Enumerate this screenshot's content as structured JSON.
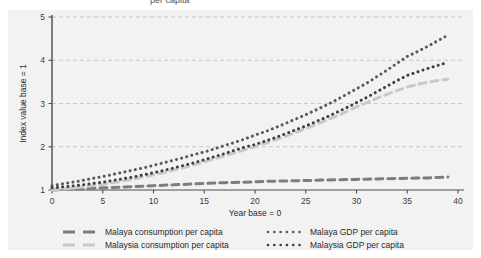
{
  "figure": {
    "background": "#f2f2f2",
    "partial_top_text": "per capita",
    "axis": {
      "ylabel": "Index value base = 1",
      "xlabel": "Year base = 0",
      "yticks": [
        1,
        2,
        3,
        4,
        5
      ],
      "xticks": [
        0,
        5,
        10,
        15,
        20,
        25,
        30,
        35,
        40
      ]
    }
  },
  "colors": {
    "dark_gray": "#7d7d7d",
    "light_gray": "#c9c9c9",
    "dark_dotted": "#4a4a4a",
    "axis": "#4d4d4d",
    "grid": "#bdbdbd",
    "panel": "#f2f2f2",
    "text": "#2b2b2b"
  },
  "legend": {
    "entries": [
      {
        "label": "Malaya consumption per capita",
        "style": "dashed",
        "color": "#7d7d7d",
        "col": 0,
        "row": 0
      },
      {
        "label": "Malaysia consumption per capita",
        "style": "dashed",
        "color": "#c9c9c9",
        "col": 0,
        "row": 1
      },
      {
        "label": "Malaya GDP per capita",
        "style": "dotted",
        "color": "#5a5a5a",
        "col": 1,
        "row": 0
      },
      {
        "label": "Malaysia GDP per capita",
        "style": "dotted",
        "color": "#3f3f3f",
        "col": 1,
        "row": 1
      }
    ]
  },
  "chart_data": {
    "type": "line",
    "title": "",
    "xlabel": "Year base = 0",
    "ylabel": "Index value base = 1",
    "xlim": [
      0,
      40
    ],
    "ylim": [
      1,
      5
    ],
    "xticks": [
      0,
      5,
      10,
      15,
      20,
      25,
      30,
      35,
      40
    ],
    "yticks": [
      1,
      2,
      3,
      4,
      5
    ],
    "grid": true,
    "legend_position": "below-axes",
    "x": [
      0,
      1,
      2,
      3,
      4,
      5,
      6,
      7,
      8,
      9,
      10,
      11,
      12,
      13,
      14,
      15,
      16,
      17,
      18,
      19,
      20,
      21,
      22,
      23,
      24,
      25,
      26,
      27,
      28,
      29,
      30,
      31,
      32,
      33,
      34,
      35,
      36,
      37,
      38,
      39
    ],
    "series": [
      {
        "name": "Malaya consumption per capita",
        "style": "dashed",
        "color": "#7d7d7d",
        "values": [
          1.0,
          1.01,
          1.02,
          1.03,
          1.04,
          1.05,
          1.06,
          1.07,
          1.08,
          1.09,
          1.1,
          1.11,
          1.12,
          1.13,
          1.14,
          1.15,
          1.16,
          1.17,
          1.175,
          1.18,
          1.19,
          1.2,
          1.205,
          1.21,
          1.215,
          1.22,
          1.225,
          1.23,
          1.235,
          1.24,
          1.245,
          1.25,
          1.255,
          1.26,
          1.265,
          1.27,
          1.275,
          1.28,
          1.29,
          1.3
        ]
      },
      {
        "name": "Malaysia consumption per capita",
        "style": "dashed",
        "color": "#c9c9c9",
        "values": [
          1.0,
          1.02,
          1.04,
          1.07,
          1.1,
          1.13,
          1.17,
          1.21,
          1.25,
          1.3,
          1.35,
          1.4,
          1.46,
          1.52,
          1.58,
          1.65,
          1.72,
          1.79,
          1.86,
          1.93,
          2.0,
          2.08,
          2.16,
          2.24,
          2.33,
          2.42,
          2.51,
          2.61,
          2.71,
          2.81,
          2.92,
          3.02,
          3.12,
          3.21,
          3.3,
          3.38,
          3.44,
          3.49,
          3.53,
          3.56
        ]
      },
      {
        "name": "Malaya GDP per capita",
        "style": "dotted",
        "color": "#5a5a5a",
        "values": [
          1.1,
          1.14,
          1.18,
          1.22,
          1.27,
          1.31,
          1.36,
          1.41,
          1.46,
          1.51,
          1.57,
          1.63,
          1.69,
          1.75,
          1.82,
          1.88,
          1.95,
          2.03,
          2.1,
          2.18,
          2.27,
          2.35,
          2.44,
          2.54,
          2.64,
          2.74,
          2.85,
          2.96,
          3.08,
          3.21,
          3.34,
          3.47,
          3.62,
          3.77,
          3.93,
          4.09,
          4.2,
          4.32,
          4.45,
          4.58
        ]
      },
      {
        "name": "Malaysia GDP per capita",
        "style": "dotted",
        "color": "#3f3f3f",
        "values": [
          1.05,
          1.07,
          1.09,
          1.12,
          1.15,
          1.18,
          1.22,
          1.26,
          1.3,
          1.35,
          1.4,
          1.45,
          1.51,
          1.57,
          1.63,
          1.7,
          1.77,
          1.84,
          1.92,
          1.99,
          2.05,
          2.13,
          2.21,
          2.3,
          2.39,
          2.48,
          2.58,
          2.68,
          2.79,
          2.9,
          3.02,
          3.14,
          3.27,
          3.4,
          3.53,
          3.65,
          3.73,
          3.81,
          3.88,
          3.95
        ]
      }
    ]
  }
}
